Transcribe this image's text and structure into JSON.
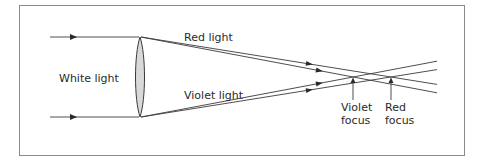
{
  "diagram": {
    "type": "optics-chromatic-aberration",
    "labels": {
      "white_light": "White light",
      "red_light": "Red light",
      "violet_light": "Violet light",
      "violet_focus_line1": "Violet",
      "violet_focus_line2": "focus",
      "red_focus_line1": "Red",
      "red_focus_line2": "focus"
    },
    "colors": {
      "line": "#3a3a3a",
      "frame": "#8a8a8a",
      "lens_fill": "#d9d9d9",
      "text": "#2a2a2a"
    }
  }
}
